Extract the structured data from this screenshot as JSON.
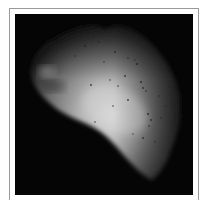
{
  "figure": {
    "colors": {
      "background": "#050505",
      "frame_border": "#9a9a9a",
      "body_highlight": "#d8d8d8",
      "body_mid": "#8a8a8a",
      "body_shadow": "#1a1a1a"
    }
  }
}
